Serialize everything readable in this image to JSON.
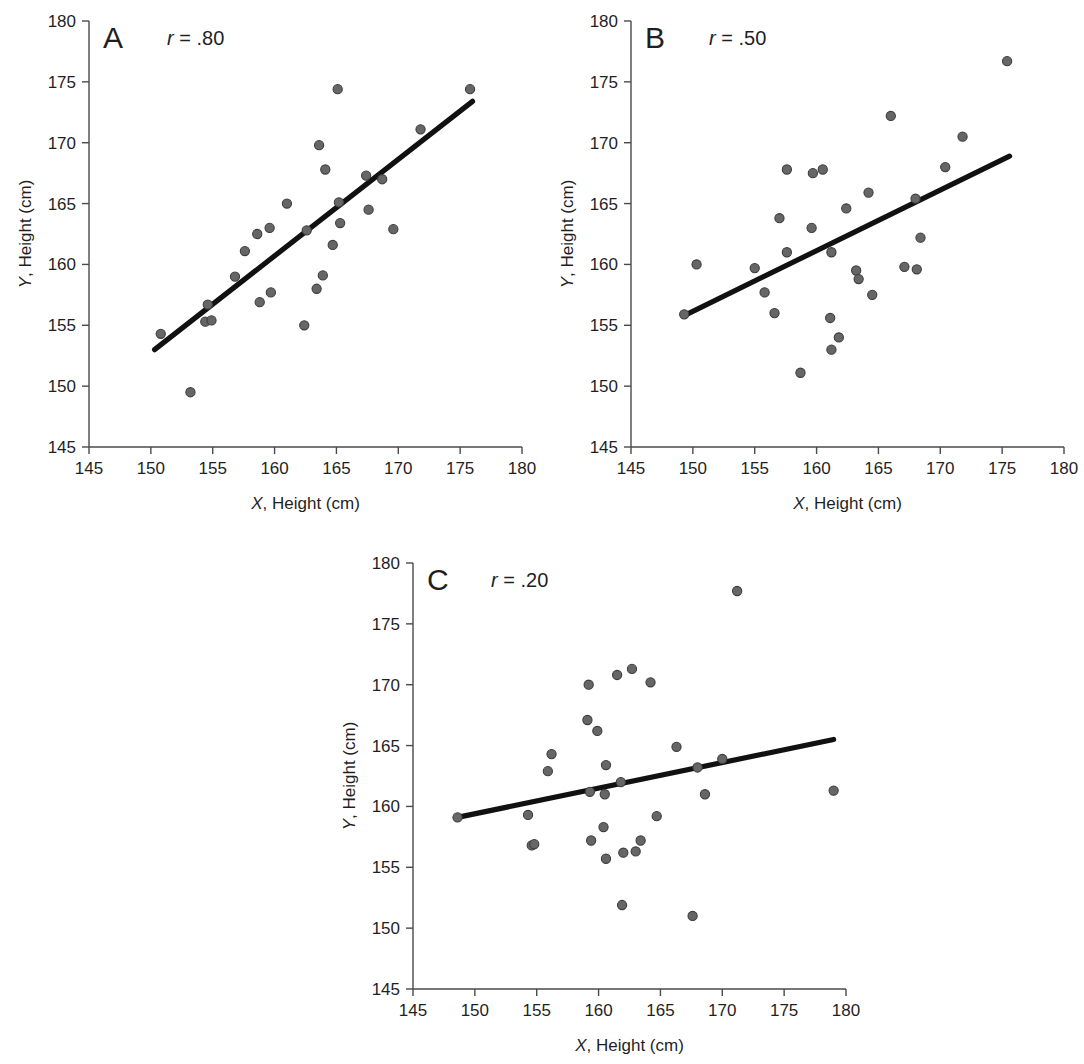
{
  "figure": {
    "background": "#ffffff",
    "marker_color": "#666666",
    "marker_edge_color": "#3d3d3d",
    "line_color": "#111111",
    "axis_color": "#4a4a4a"
  },
  "chart_data": [
    {
      "type": "scatter",
      "panel": "A",
      "title": "",
      "annotation": "r = .80",
      "annotation_symbol": "r",
      "annotation_value": " = .80",
      "correlation": 0.8,
      "xlabel_symbol": "X",
      "xlabel_rest": ", Height (cm)",
      "ylabel_symbol": "Y",
      "ylabel_rest": ", Height (cm)",
      "xlim": [
        145,
        180
      ],
      "ylim": [
        145,
        180
      ],
      "xticks": [
        145,
        150,
        155,
        160,
        165,
        170,
        175,
        180
      ],
      "yticks": [
        145,
        150,
        155,
        160,
        165,
        170,
        175,
        180
      ],
      "grid": false,
      "legend": false,
      "points": [
        [
          150.8,
          154.3
        ],
        [
          153.2,
          149.5
        ],
        [
          154.4,
          155.3
        ],
        [
          154.6,
          156.7
        ],
        [
          154.9,
          155.4
        ],
        [
          156.8,
          159.0
        ],
        [
          157.6,
          161.1
        ],
        [
          158.6,
          162.5
        ],
        [
          158.8,
          156.9
        ],
        [
          159.6,
          163.0
        ],
        [
          159.7,
          157.7
        ],
        [
          161.0,
          165.0
        ],
        [
          162.4,
          155.0
        ],
        [
          162.6,
          162.8
        ],
        [
          163.4,
          158.0
        ],
        [
          163.6,
          169.8
        ],
        [
          163.9,
          159.1
        ],
        [
          164.1,
          167.8
        ],
        [
          164.7,
          161.6
        ],
        [
          165.1,
          174.4
        ],
        [
          165.2,
          165.1
        ],
        [
          165.3,
          163.4
        ],
        [
          167.4,
          167.3
        ],
        [
          167.6,
          164.5
        ],
        [
          168.7,
          167.0
        ],
        [
          169.6,
          162.9
        ],
        [
          171.8,
          171.1
        ],
        [
          175.8,
          174.4
        ]
      ],
      "fit_line": {
        "x": [
          150.3,
          176.0
        ],
        "y": [
          153.0,
          173.4
        ]
      }
    },
    {
      "type": "scatter",
      "panel": "B",
      "title": "",
      "annotation": "r = .50",
      "annotation_symbol": "r",
      "annotation_value": " = .50",
      "correlation": 0.5,
      "xlabel_symbol": "X",
      "xlabel_rest": ", Height (cm)",
      "ylabel_symbol": "Y",
      "ylabel_rest": ", Height (cm)",
      "xlim": [
        145,
        180
      ],
      "ylim": [
        145,
        180
      ],
      "xticks": [
        145,
        150,
        155,
        160,
        165,
        170,
        175,
        180
      ],
      "yticks": [
        145,
        150,
        155,
        160,
        165,
        170,
        175,
        180
      ],
      "grid": false,
      "legend": false,
      "points": [
        [
          149.3,
          155.9
        ],
        [
          150.3,
          160.0
        ],
        [
          155.0,
          159.7
        ],
        [
          155.8,
          157.7
        ],
        [
          156.6,
          156.0
        ],
        [
          157.0,
          163.8
        ],
        [
          157.6,
          161.0
        ],
        [
          157.6,
          167.8
        ],
        [
          158.7,
          151.1
        ],
        [
          159.6,
          163.0
        ],
        [
          159.7,
          167.5
        ],
        [
          160.5,
          167.8
        ],
        [
          161.1,
          155.6
        ],
        [
          161.2,
          153.0
        ],
        [
          161.2,
          161.0
        ],
        [
          161.8,
          154.0
        ],
        [
          162.4,
          164.6
        ],
        [
          163.2,
          159.5
        ],
        [
          163.4,
          158.8
        ],
        [
          164.2,
          165.9
        ],
        [
          164.5,
          157.5
        ],
        [
          166.0,
          172.2
        ],
        [
          167.1,
          159.8
        ],
        [
          168.0,
          165.4
        ],
        [
          168.1,
          159.6
        ],
        [
          168.4,
          162.2
        ],
        [
          170.4,
          168.0
        ],
        [
          171.8,
          170.5
        ],
        [
          175.4,
          176.7
        ]
      ],
      "fit_line": {
        "x": [
          149.3,
          175.6
        ],
        "y": [
          155.8,
          168.9
        ]
      }
    },
    {
      "type": "scatter",
      "panel": "C",
      "title": "",
      "annotation": "r = .20",
      "annotation_symbol": "r",
      "annotation_value": " = .20",
      "correlation": 0.2,
      "xlabel_symbol": "X",
      "xlabel_rest": ", Height (cm)",
      "ylabel_symbol": "Y",
      "ylabel_rest": ", Height (cm)",
      "xlim": [
        145,
        180
      ],
      "ylim": [
        145,
        180
      ],
      "xticks": [
        145,
        150,
        155,
        160,
        165,
        170,
        175,
        180
      ],
      "yticks": [
        145,
        150,
        155,
        160,
        165,
        170,
        175,
        180
      ],
      "grid": false,
      "legend": false,
      "points": [
        [
          148.6,
          159.1
        ],
        [
          154.3,
          159.3
        ],
        [
          154.6,
          156.8
        ],
        [
          154.8,
          156.9
        ],
        [
          155.9,
          162.9
        ],
        [
          156.2,
          164.3
        ],
        [
          159.1,
          167.1
        ],
        [
          159.2,
          170.0
        ],
        [
          159.3,
          161.2
        ],
        [
          159.4,
          157.2
        ],
        [
          159.9,
          166.2
        ],
        [
          160.4,
          158.3
        ],
        [
          160.5,
          161.0
        ],
        [
          160.6,
          163.4
        ],
        [
          160.6,
          155.7
        ],
        [
          161.5,
          170.8
        ],
        [
          161.8,
          162.0
        ],
        [
          161.9,
          151.9
        ],
        [
          162.0,
          156.2
        ],
        [
          162.7,
          171.3
        ],
        [
          163.0,
          156.3
        ],
        [
          163.4,
          157.2
        ],
        [
          164.2,
          170.2
        ],
        [
          164.7,
          159.2
        ],
        [
          166.3,
          164.9
        ],
        [
          167.6,
          151.0
        ],
        [
          168.0,
          163.2
        ],
        [
          168.6,
          161.0
        ],
        [
          170.0,
          163.9
        ],
        [
          171.2,
          177.7
        ],
        [
          179.0,
          161.3
        ]
      ],
      "fit_line": {
        "x": [
          148.6,
          179.0
        ],
        "y": [
          159.1,
          165.5
        ]
      }
    }
  ]
}
